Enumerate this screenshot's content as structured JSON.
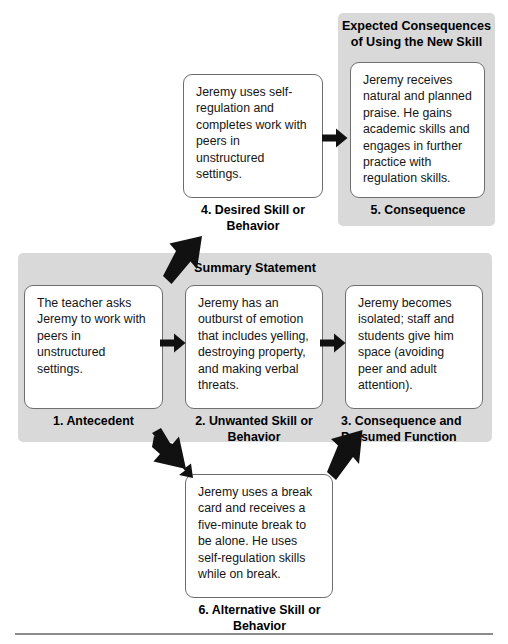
{
  "diagram": {
    "sections": {
      "consequence_panel_heading": "Expected Consequences\nof Using the New Skill",
      "summary_heading": "Summary Statement"
    },
    "boxes": [
      {
        "id": "box-1",
        "number": "1",
        "caption": "1. Antecedent",
        "text": "The teacher asks Jeremy to work with peers in unstructured settings."
      },
      {
        "id": "box-2",
        "number": "2",
        "caption": "2. Unwanted Skill or Behavior",
        "text": "Jeremy has an outburst of emotion that includes yelling, destroying property, and making verbal threats."
      },
      {
        "id": "box-3",
        "number": "3",
        "caption": "3. Consequence and Presumed Function",
        "text": "Jeremy becomes isolated; staff and students give him space (avoiding peer and adult attention)."
      },
      {
        "id": "box-4",
        "number": "4",
        "caption": "4. Desired Skill or Behavior",
        "text": "Jeremy uses self-regulation and completes work with peers in unstructured settings."
      },
      {
        "id": "box-5",
        "number": "5",
        "caption": "5. Consequence",
        "text": "Jeremy receives natural and planned praise. He gains academic skills and engages in further practice with regulation skills."
      },
      {
        "id": "box-6",
        "number": "6",
        "caption": "6. Alternative Skill or Behavior",
        "text": "Jeremy uses a break card and receives a five-minute break to be alone. He uses self-regulation skills while on break."
      }
    ],
    "arrows": [
      {
        "id": "arrow-1to2",
        "from": "1. Antecedent",
        "to": "2. Unwanted Skill or Behavior",
        "direction": "right"
      },
      {
        "id": "arrow-2to3",
        "from": "2. Unwanted Skill or Behavior",
        "to": "3. Consequence and Presumed Function",
        "direction": "right"
      },
      {
        "id": "arrow-4to5",
        "from": "4. Desired Skill or Behavior",
        "to": "5. Consequence",
        "direction": "right"
      },
      {
        "id": "arrow-1to4",
        "from": "1. Antecedent",
        "to": "4. Desired Skill or Behavior",
        "direction": "up-right"
      },
      {
        "id": "arrow-2to6",
        "from": "2. Unwanted Skill or Behavior",
        "to": "6. Alternative Skill or Behavior",
        "direction": "down-right"
      },
      {
        "id": "arrow-6to3",
        "from": "6. Alternative Skill or Behavior",
        "to": "3. Consequence and Presumed Function",
        "direction": "up-right"
      }
    ],
    "colors": {
      "panel_gray": "#d9d9d9",
      "box_border": "#6e6e6e",
      "arrow_black": "#111111",
      "rule_gray": "#8c8c8c",
      "background": "#ffffff"
    }
  }
}
